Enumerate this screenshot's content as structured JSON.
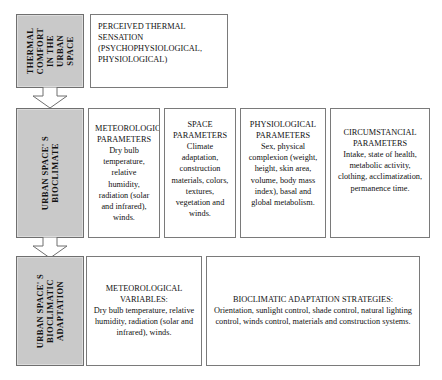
{
  "diagram": {
    "colors": {
      "gray_fill": "#c9c9c9",
      "box_border": "#7a7a7a",
      "background": "#ffffff",
      "text": "#111111"
    },
    "rows": [
      {
        "id": "row-1",
        "label_lines": [
          "THERMAL",
          "COMFORT",
          "IN THE",
          "URBAN",
          "SPACE"
        ],
        "cells": [
          {
            "id": "perceived-thermal-sensation",
            "heading": "PERCEIVED THERMAL SENSATION",
            "body": "(PSYCHOPHYSIOLOGICAL, PHYSIOLOGICAL)"
          }
        ]
      },
      {
        "id": "row-2",
        "label_lines": [
          "URBAN SPACE' S",
          "BIOCLIMATE"
        ],
        "cells": [
          {
            "id": "meteorological-parameters",
            "heading": "METEOROLOGICAL PARAMETERS",
            "body": "Dry bulb temperature, relative humidity, radiation (solar and infrared), winds."
          },
          {
            "id": "space-parameters",
            "heading": "SPACE PARAMETERS",
            "body": "Climate adaptation, construction materials, colors, textures, vegetation and winds."
          },
          {
            "id": "physiological-parameters",
            "heading": "PHYSIOLOGICAL PARAMETERS",
            "body": "Sex, physical complexion (weight, height, skin area, volume, body mass index), basal and global metabolism."
          },
          {
            "id": "circumstancial-parameters",
            "heading": "CIRCUMSTANCIAL PARAMETERS",
            "body": "Intake, state of health, metabolic activity, clothing, acclimatization, permanence time."
          }
        ]
      },
      {
        "id": "row-3",
        "label_lines": [
          "URBAN SPACE' S",
          "BIOCLIMATIC",
          "ADAPTATION"
        ],
        "cells": [
          {
            "id": "meteorological-variables",
            "heading": "METEOROLOGICAL VARIABLES:",
            "body": "Dry bulb temperature, relative humidity, radiation (solar and infrared), winds."
          },
          {
            "id": "bioclimatic-adaptation-strategies",
            "heading": "BIOCLIMATIC ADAPTATION STRATEGIES:",
            "body": "Orientation, sunlight control, shade control, natural lighting control, winds control, materials and construction systems."
          }
        ]
      }
    ],
    "connectors": [
      {
        "id": "arrow-row1-to-row2",
        "icon": "down-block-arrow-icon"
      },
      {
        "id": "arrow-row2-to-row3",
        "icon": "down-block-arrow-icon"
      }
    ]
  }
}
